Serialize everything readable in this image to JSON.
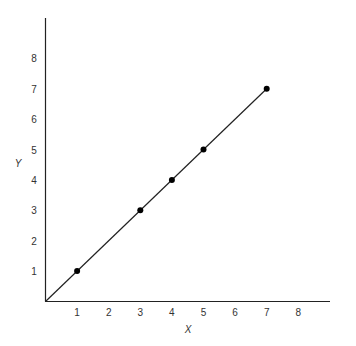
{
  "chart_data": {
    "type": "line",
    "title": "",
    "xlabel": "X",
    "ylabel": "Y",
    "xlim": [
      0,
      9
    ],
    "ylim": [
      0,
      9
    ],
    "grid": false,
    "legend": null,
    "x_ticks": [
      "1",
      "2",
      "3",
      "4",
      "5",
      "6",
      "7",
      "8"
    ],
    "y_ticks": [
      "1",
      "2",
      "3",
      "4",
      "5",
      "6",
      "7",
      "8"
    ],
    "series": [
      {
        "name": "y = x",
        "line": {
          "from": [
            0,
            0
          ],
          "to": [
            7,
            7
          ]
        },
        "points": [
          {
            "x": 1,
            "y": 1
          },
          {
            "x": 3,
            "y": 3
          },
          {
            "x": 4,
            "y": 4
          },
          {
            "x": 5,
            "y": 5
          },
          {
            "x": 7,
            "y": 7
          }
        ]
      }
    ]
  }
}
